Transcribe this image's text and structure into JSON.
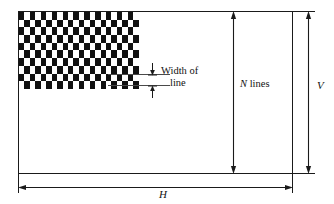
{
  "figure": {
    "background_color": "#ffffff",
    "line_color": "#1a1a1a",
    "pattern_color": "#111111"
  },
  "screen": {
    "name": "display-area-rectangle",
    "border_color": "#1a1a1a"
  },
  "raster": {
    "name": "checkerboard-raster-pattern",
    "columns": 22,
    "rows": 10,
    "dark_color": "#111111",
    "light_color": "#ffffff"
  },
  "labels": {
    "width_of_line_1": "Width of",
    "width_of_line_2": "line",
    "n_lines_var": "N",
    "n_lines_text": " lines",
    "vertical": "V",
    "horizontal": "H"
  },
  "dimensions": {
    "n_lines": {
      "label": "N lines",
      "orientation": "vertical",
      "arrow_style": "double-headed"
    },
    "vertical_extent": {
      "label": "V",
      "orientation": "vertical",
      "arrow_style": "double-headed"
    },
    "horizontal_extent": {
      "label": "H",
      "orientation": "horizontal",
      "arrow_style": "double-headed"
    },
    "line_width": {
      "label": "Width of line",
      "orientation": "vertical",
      "arrow_style": "double-headed-inward"
    }
  }
}
